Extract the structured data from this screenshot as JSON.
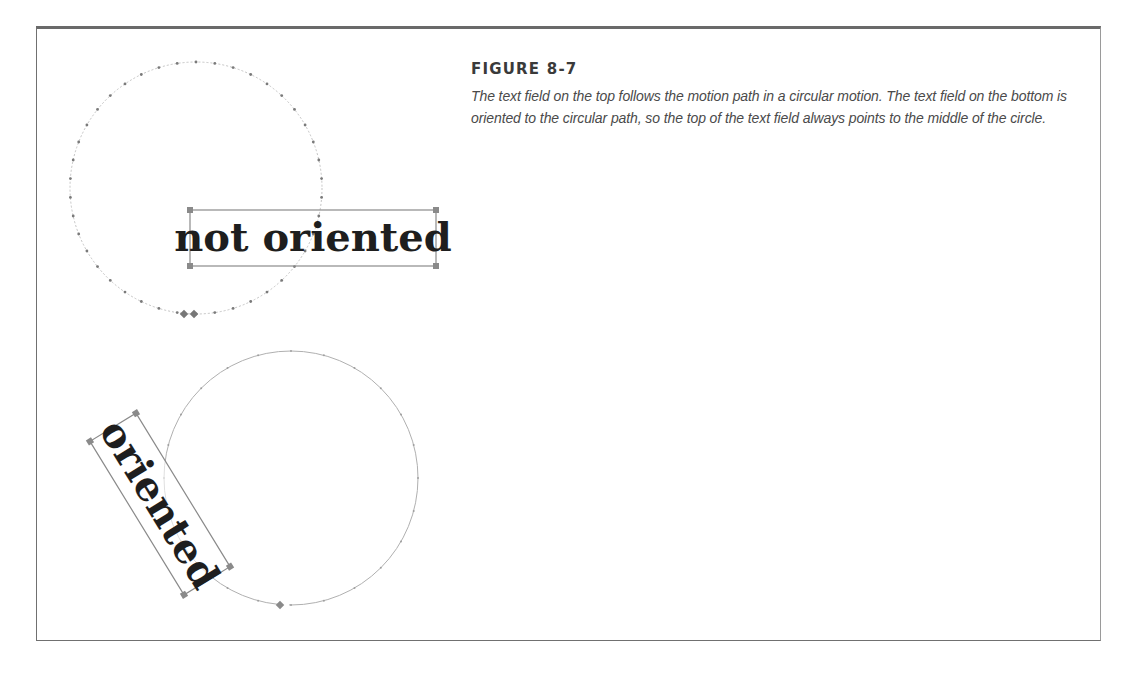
{
  "figure": {
    "label": "FIGURE 8-7",
    "caption": "The text field on the top follows the motion path in a circular motion. The text field on the bottom is oriented to the circular path, so the top of the text field always points to the middle of the circle."
  },
  "illustration": {
    "top_example": {
      "text_field_label": "not oriented",
      "path": "circular motion path (dotted, with frame markers)"
    },
    "bottom_example": {
      "text_field_label": "oriented",
      "path": "circular motion path (oriented to path)"
    }
  },
  "colors": {
    "frame_border": "#707070",
    "path_line": "#a8a8a8",
    "path_dot": "#777777",
    "handle": "#8a8a8a",
    "label_text": "#1e1e1e",
    "caption_text": "#4a4a4a"
  }
}
